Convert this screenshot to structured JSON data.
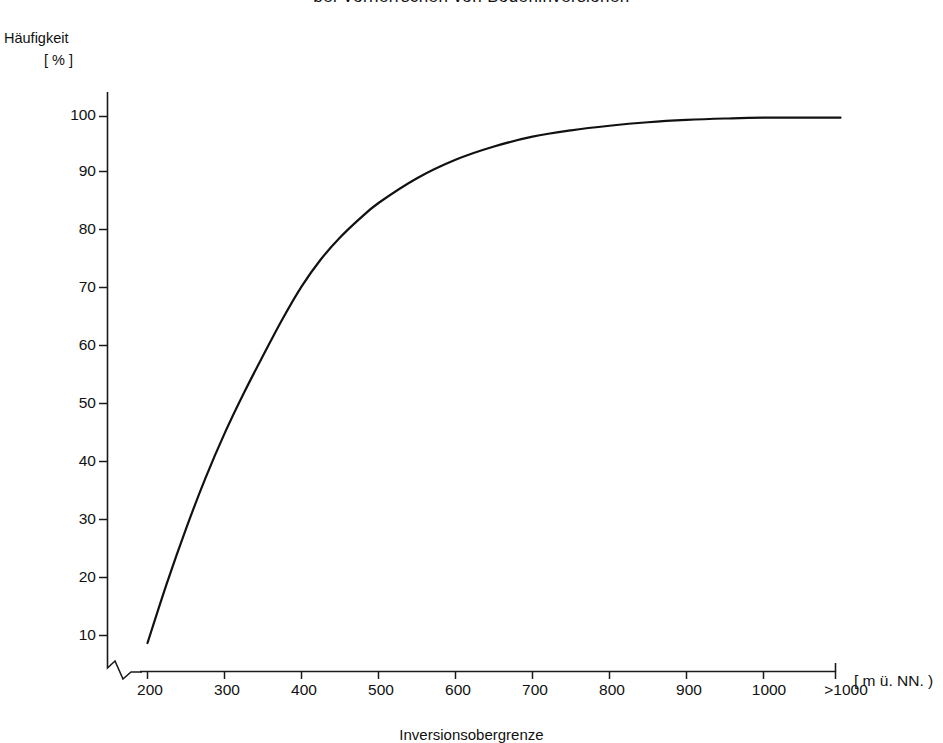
{
  "title": "bei Vorherrschen von Bodeninversionen",
  "y_axis": {
    "name": "Häufigkeit",
    "unit": "[ % ]",
    "ticks": [
      "10",
      "20",
      "30",
      "40",
      "50",
      "60",
      "70",
      "80",
      "90",
      "100"
    ]
  },
  "x_axis": {
    "name": "Inversionsobergrenze",
    "unit": "[ m ü. NN. )",
    "ticks": [
      "200",
      "300",
      "400",
      "500",
      "600",
      "700",
      "800",
      "900",
      "1000",
      ">1000"
    ]
  },
  "colors": {
    "line": "#111111",
    "axis": "#1a1a1a",
    "background": "#ffffff"
  },
  "chart_data": {
    "type": "line",
    "title": "bei Vorherrschen von Bodeninversionen",
    "xlabel": "Inversionsobergrenze",
    "ylabel": "Häufigkeit [ % ]",
    "x_unit": "[ m ü. NN. )",
    "xlim": [
      200,
      1100
    ],
    "ylim": [
      0,
      100
    ],
    "grid": false,
    "legend": null,
    "categories": [
      "200",
      "300",
      "400",
      "500",
      "600",
      "700",
      "800",
      "900",
      "1000",
      ">1000"
    ],
    "series": [
      {
        "name": "Kumulative Häufigkeit",
        "values": [
          8.7,
          45.0,
          70.5,
          85.0,
          92.5,
          96.5,
          98.4,
          99.4,
          99.8,
          99.8
        ]
      }
    ],
    "points": [
      {
        "x": 200,
        "y": 8.7
      },
      {
        "x": 225,
        "y": 19.0
      },
      {
        "x": 250,
        "y": 28.5
      },
      {
        "x": 275,
        "y": 37.2
      },
      {
        "x": 300,
        "y": 45.0
      },
      {
        "x": 325,
        "y": 52.0
      },
      {
        "x": 350,
        "y": 58.5
      },
      {
        "x": 375,
        "y": 64.8
      },
      {
        "x": 400,
        "y": 70.5
      },
      {
        "x": 425,
        "y": 75.2
      },
      {
        "x": 450,
        "y": 79.0
      },
      {
        "x": 475,
        "y": 82.2
      },
      {
        "x": 500,
        "y": 85.0
      },
      {
        "x": 550,
        "y": 89.3
      },
      {
        "x": 600,
        "y": 92.5
      },
      {
        "x": 650,
        "y": 94.8
      },
      {
        "x": 700,
        "y": 96.5
      },
      {
        "x": 750,
        "y": 97.6
      },
      {
        "x": 800,
        "y": 98.4
      },
      {
        "x": 850,
        "y": 99.0
      },
      {
        "x": 900,
        "y": 99.4
      },
      {
        "x": 950,
        "y": 99.65
      },
      {
        "x": 1000,
        "y": 99.8
      },
      {
        "x": 1100,
        "y": 99.8
      }
    ]
  }
}
